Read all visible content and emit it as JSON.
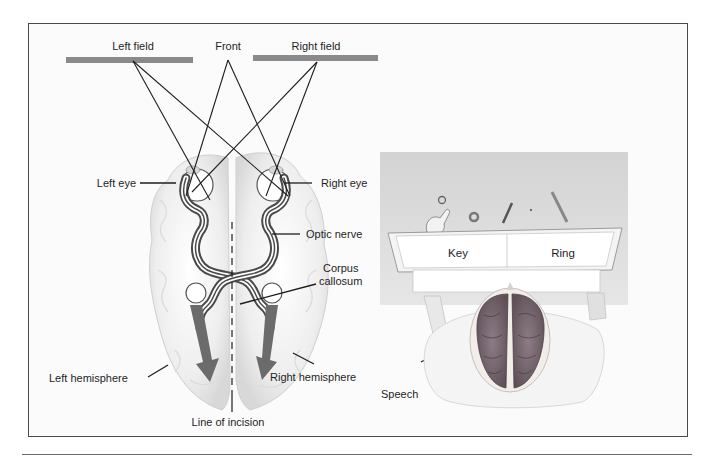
{
  "figure": {
    "left_panel": {
      "title": "Split-brain visual pathways",
      "labels": {
        "left_field": "Left field",
        "front": "Front",
        "right_field": "Right field",
        "left_eye": "Left eye",
        "right_eye": "Right eye",
        "optic_nerve": "Optic nerve",
        "corpus_callosum_line1": "Corpus",
        "corpus_callosum_line2": "callosum",
        "left_hemisphere": "Left hemisphere",
        "right_hemisphere": "Right hemisphere",
        "line_of_incision": "Line of incision"
      }
    },
    "right_panel": {
      "screen": {
        "left_word": "Key",
        "right_word": "Ring"
      },
      "labels": {
        "speech": "Speech"
      },
      "objects_on_table": [
        "key",
        "ring",
        "pencil",
        "small object",
        "stick"
      ]
    },
    "colors": {
      "frame_border": "#4a4a4a",
      "field_bar": "#8a8a8a",
      "brain_fill": "#ececec",
      "arrow": "#6b6b6b",
      "table": "#dcdcdc",
      "subject_brain": "#7a6a72"
    }
  }
}
